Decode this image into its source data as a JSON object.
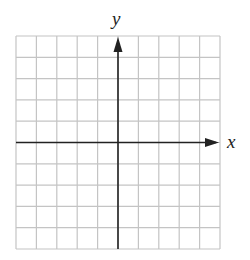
{
  "diagram": {
    "type": "coordinate-grid",
    "columns": 10,
    "rows": 10,
    "grid": {
      "left": 16,
      "top": 36,
      "right": 220,
      "bottom": 249
    },
    "origin_col": 5,
    "origin_row": 5,
    "axes": {
      "x_label": "x",
      "y_label": "y"
    },
    "colors": {
      "grid_line": "#c4c4c4",
      "axis": "#222222",
      "label": "#222222"
    }
  }
}
